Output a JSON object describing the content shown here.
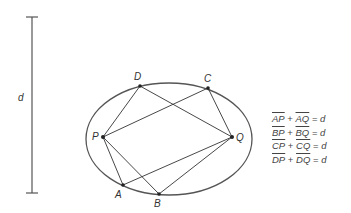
{
  "diagram": {
    "scale": {
      "label": "d"
    },
    "points": {
      "P": {
        "label": "P"
      },
      "Q": {
        "label": "Q"
      },
      "A": {
        "label": "A"
      },
      "B": {
        "label": "B"
      },
      "C": {
        "label": "C"
      },
      "D": {
        "label": "D"
      }
    },
    "equations": [
      {
        "s1": "AP",
        "plus": "+",
        "s2": "AQ",
        "eq": "=",
        "rhs": "d"
      },
      {
        "s1": "BP",
        "plus": "+",
        "s2": "BQ",
        "eq": "=",
        "rhs": "d"
      },
      {
        "s1": "CP",
        "plus": "+",
        "s2": "CQ",
        "eq": "=",
        "rhs": "d"
      },
      {
        "s1": "DP",
        "plus": "+",
        "s2": "DQ",
        "eq": "=",
        "rhs": "d"
      }
    ],
    "colors": {
      "ellipse": "#555555",
      "lines": "#333333",
      "points": "#222222"
    }
  }
}
